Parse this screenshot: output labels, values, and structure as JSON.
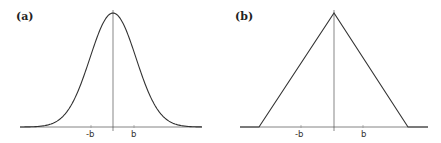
{
  "panels": [
    {
      "label": "(a)",
      "shape": "gaussian",
      "ticks": {
        "neg": "-b",
        "pos": "b"
      }
    },
    {
      "label": "(b)",
      "shape": "triangle",
      "ticks": {
        "neg": "-b",
        "pos": "b"
      }
    }
  ],
  "colors": {
    "line": "#333333",
    "axis": "#555555"
  }
}
